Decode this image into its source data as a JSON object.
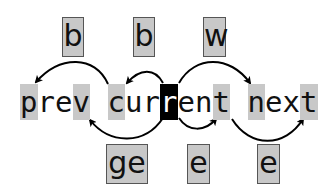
{
  "diagram": {
    "text_line": "prev current next",
    "chars": [
      "p",
      "r",
      "e",
      "v",
      " ",
      "c",
      "u",
      "r",
      "r",
      "e",
      "n",
      "t",
      " ",
      "n",
      "e",
      "x",
      "t"
    ],
    "highlighted_indices": [
      0,
      3,
      5,
      11,
      13,
      16
    ],
    "cursor_index": 8,
    "keys_top": [
      {
        "label": "b",
        "target": "prev (start)"
      },
      {
        "label": "b",
        "target": "current (start)"
      },
      {
        "label": "w",
        "target": "next (start)"
      }
    ],
    "keys_bottom": [
      {
        "label": "ge",
        "target": "prev (end)"
      },
      {
        "label": "e",
        "target": "current (end)"
      },
      {
        "label": "e",
        "target": "next (end)"
      }
    ],
    "colors": {
      "highlight": "#c8c8c8",
      "cursor_bg": "#000000",
      "cursor_fg": "#ffffff",
      "arrow": "#000000"
    }
  }
}
